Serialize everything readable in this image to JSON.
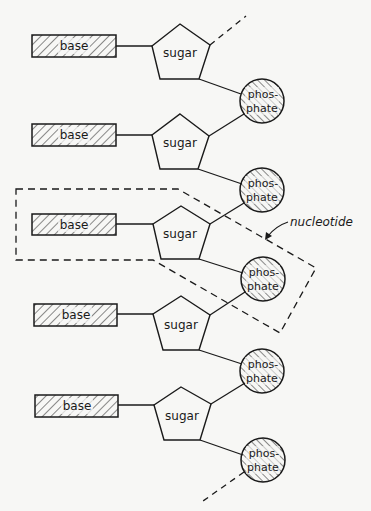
{
  "diagram": {
    "title": "",
    "colors": {
      "ink": "#1a1a1a",
      "background": "#f7f7f5"
    },
    "units": [
      {
        "base": "base",
        "sugar": "sugar",
        "phosphate": [
          "phos-",
          "phate"
        ]
      },
      {
        "base": "base",
        "sugar": "sugar",
        "phosphate": [
          "phos-",
          "phate"
        ]
      },
      {
        "base": "base",
        "sugar": "sugar",
        "phosphate": [
          "phos-",
          "phate"
        ]
      },
      {
        "base": "base",
        "sugar": "sugar",
        "phosphate": [
          "phos-",
          "phate"
        ]
      },
      {
        "base": "base",
        "sugar": "sugar",
        "phosphate": [
          "phos-",
          "phate"
        ]
      }
    ],
    "annotation": {
      "label": "nucleotide",
      "encloses_unit_index": 2
    },
    "continuation": {
      "top": "dashed line continues chain upward",
      "bottom": "dashed line continues chain downward"
    }
  }
}
